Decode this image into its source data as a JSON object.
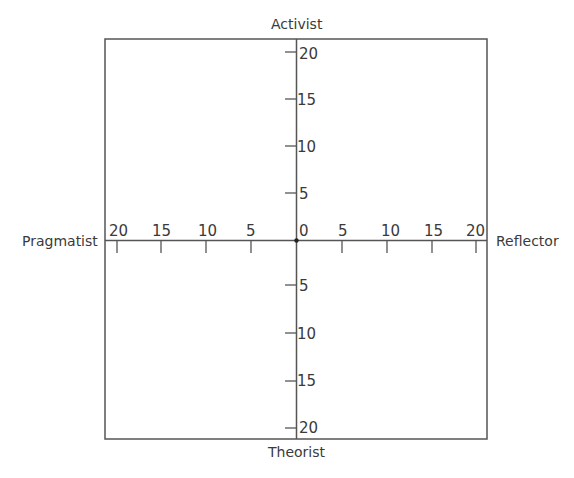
{
  "diagram": {
    "type": "quadrant-axes",
    "labels": {
      "top": "Activist",
      "bottom": "Theorist",
      "left": "Pragmatist",
      "right": "Reflector"
    },
    "horizontal_ticks_left": [
      "20",
      "15",
      "10",
      "5"
    ],
    "horizontal_ticks_right": [
      "0",
      "5",
      "10",
      "15",
      "20"
    ],
    "vertical_ticks_top": [
      "20",
      "15",
      "10",
      "5"
    ],
    "vertical_ticks_bottom": [
      "5",
      "10",
      "15",
      "20"
    ],
    "colors": {
      "line": "#555555",
      "text": "#3a3a3a",
      "background": "#ffffff"
    }
  }
}
